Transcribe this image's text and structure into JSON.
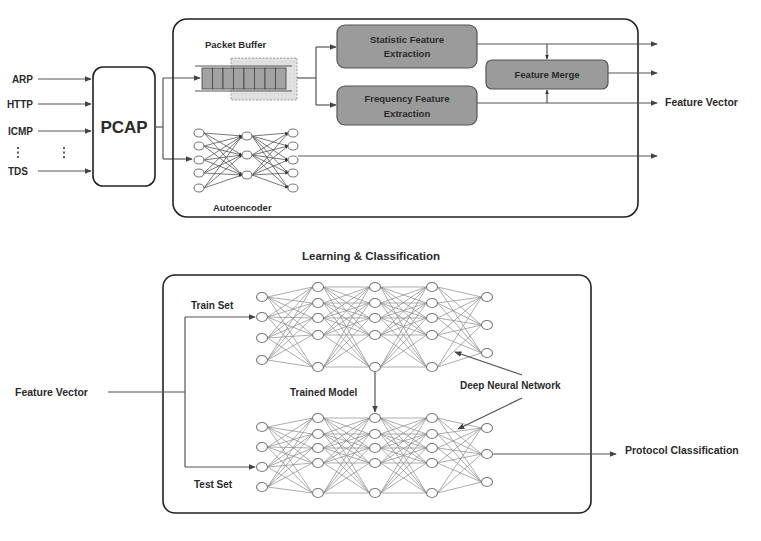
{
  "preprocessing": {
    "inputs": [
      "ARP",
      "HTTP",
      "ICMP",
      "TDS"
    ],
    "ellipsis": "⋮",
    "pcap_label": "PCAP",
    "packet_buffer_label": "Packet Buffer",
    "autoencoder_label": "Autoencoder",
    "statistic_box": {
      "line1": "Statistic Feature",
      "line2": "Extraction"
    },
    "frequency_box": {
      "line1": "Frequency Feature",
      "line2": "Extraction"
    },
    "merge_box": "Feature Merge",
    "output_label": "Feature Vector"
  },
  "learning": {
    "title": "Learning & Classification",
    "input_label": "Feature Vector",
    "train_label": "Train Set",
    "test_label": "Test Set",
    "trained_model_label": "Trained Model",
    "dnn_label": "Deep Neural Network",
    "output_label": "Protocol Classification"
  },
  "colors": {
    "box_fill": "#9b9b9b",
    "line": "#555555",
    "frame": "#222222"
  }
}
